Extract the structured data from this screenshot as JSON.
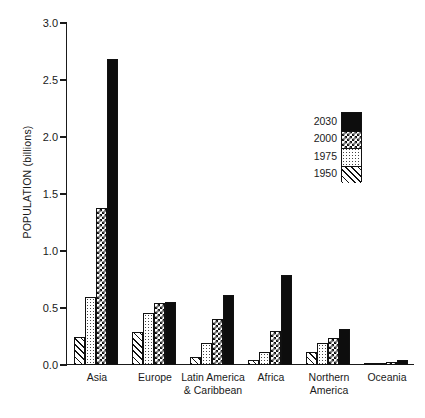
{
  "chart_data": {
    "type": "bar",
    "title": "",
    "subtitle": "",
    "xlabel": "",
    "ylabel": "POPULATION (billions)",
    "ylim": [
      0.0,
      3.0
    ],
    "ytick_labels": [
      "3.0",
      "2.5",
      "2.0",
      "1.5",
      "1.0",
      "0.5",
      "0.0"
    ],
    "ytick_values": [
      3.0,
      2.5,
      2.0,
      1.5,
      1.0,
      0.5,
      0.0
    ],
    "grid": false,
    "legend_position": "upper-right-inside",
    "categories": [
      "Asia",
      "Europe",
      "Latin America\n& Caribbean",
      "Africa",
      "Northern\nAmerica",
      "Oceania"
    ],
    "series": [
      {
        "name": "1950",
        "pattern": "diagonal-hatch",
        "values": [
          0.25,
          0.29,
          0.07,
          0.04,
          0.11,
          0.01
        ]
      },
      {
        "name": "1975",
        "pattern": "fine-dots",
        "values": [
          0.6,
          0.46,
          0.19,
          0.11,
          0.19,
          0.02
        ]
      },
      {
        "name": "2000",
        "pattern": "checkerboard",
        "values": [
          1.38,
          0.54,
          0.4,
          0.3,
          0.24,
          0.03
        ]
      },
      {
        "name": "2030",
        "pattern": "solid-black",
        "values": [
          2.68,
          0.55,
          0.61,
          0.79,
          0.32,
          0.04
        ]
      }
    ],
    "legend_entries": [
      {
        "label": "2030",
        "pattern": "solid-black"
      },
      {
        "label": "2000",
        "pattern": "checkerboard"
      },
      {
        "label": "1975",
        "pattern": "fine-dots"
      },
      {
        "label": "1950",
        "pattern": "diagonal-hatch"
      }
    ],
    "colors": {
      "axis": "#1a1a1a",
      "bar_outline": "#111111",
      "solid_fill": "#0d0d0d",
      "background": "#ffffff"
    }
  }
}
